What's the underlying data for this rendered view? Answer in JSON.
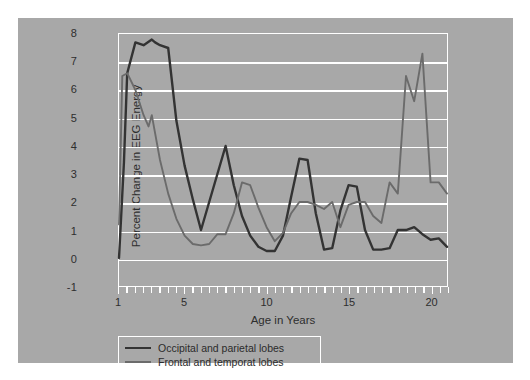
{
  "chart_data": {
    "type": "line",
    "title": "",
    "xlabel": "Age in Years",
    "ylabel": "Percent Change in EEG Energy",
    "xlim": [
      1,
      21
    ],
    "ylim": [
      -1,
      8
    ],
    "grid": true,
    "legend_position": "below-axes-left",
    "y_ticks": [
      8,
      7,
      6,
      5,
      4,
      3,
      2,
      1,
      0,
      -1
    ],
    "y_tick_labels": [
      "8",
      "7",
      "6",
      "5",
      "4",
      "3",
      "2",
      "1",
      "0",
      "-1"
    ],
    "x_ticks": [
      1,
      5,
      10,
      15,
      20
    ],
    "x_tick_labels": [
      "1",
      "5",
      "10",
      "15",
      "20"
    ],
    "x_minor_tick_step": 0.5,
    "series": [
      {
        "name": "Occipital and parietal lobes",
        "color": "#333333",
        "x": [
          1,
          1.3,
          1.5,
          2,
          2.5,
          3,
          3.2,
          3.5,
          4,
          4.5,
          5,
          5.5,
          6,
          6.5,
          7,
          7.5,
          8,
          8.5,
          9,
          9.5,
          10,
          10.5,
          11,
          11.5,
          12,
          12.5,
          13,
          13.5,
          14,
          14.5,
          15,
          15.5,
          16,
          16.5,
          17,
          17.5,
          18,
          18.5,
          19,
          19.5,
          20,
          20.5,
          21
        ],
        "values": [
          0.0,
          3.4,
          6.6,
          7.7,
          7.6,
          7.8,
          7.7,
          7.6,
          7.5,
          4.9,
          3.3,
          2.1,
          1.0,
          2.0,
          3.0,
          4.0,
          2.6,
          1.5,
          0.8,
          0.4,
          0.25,
          0.25,
          0.8,
          2.2,
          3.55,
          3.5,
          1.6,
          0.3,
          0.35,
          1.7,
          2.6,
          2.55,
          1.0,
          0.3,
          0.3,
          0.35,
          1.0,
          1.0,
          1.1,
          0.85,
          0.65,
          0.7,
          0.4
        ]
      },
      {
        "name": "Frontal and temporat lobes",
        "color": "#6b6b6b",
        "x": [
          1,
          1.2,
          1.5,
          2,
          2.5,
          2.8,
          3,
          3.5,
          4,
          4.5,
          5,
          5.5,
          6,
          6.5,
          7,
          7.5,
          8,
          8.5,
          9,
          9.5,
          10,
          10.5,
          11,
          11.5,
          12,
          12.5,
          13,
          13.5,
          14,
          14.5,
          15,
          15.5,
          16,
          16.5,
          17,
          17.5,
          18,
          18.5,
          19,
          19.5,
          20,
          20.5,
          21
        ],
        "values": [
          1.2,
          6.5,
          6.6,
          6.0,
          5.1,
          4.7,
          5.1,
          3.5,
          2.3,
          1.4,
          0.8,
          0.5,
          0.45,
          0.5,
          0.85,
          0.85,
          1.6,
          2.7,
          2.6,
          1.8,
          1.1,
          0.6,
          0.9,
          1.6,
          2.0,
          2.0,
          1.9,
          1.75,
          2.0,
          1.1,
          1.9,
          2.0,
          2.0,
          1.5,
          1.25,
          2.7,
          2.3,
          6.5,
          5.6,
          7.3,
          2.7,
          2.7,
          2.3
        ]
      }
    ]
  },
  "legend": {
    "entries": [
      {
        "label": "Occipital and parietal lobes",
        "color": "#333333",
        "width": 2.6
      },
      {
        "label": "Frontal and temporat lobes",
        "color": "#6b6b6b",
        "width": 2.0
      }
    ]
  }
}
